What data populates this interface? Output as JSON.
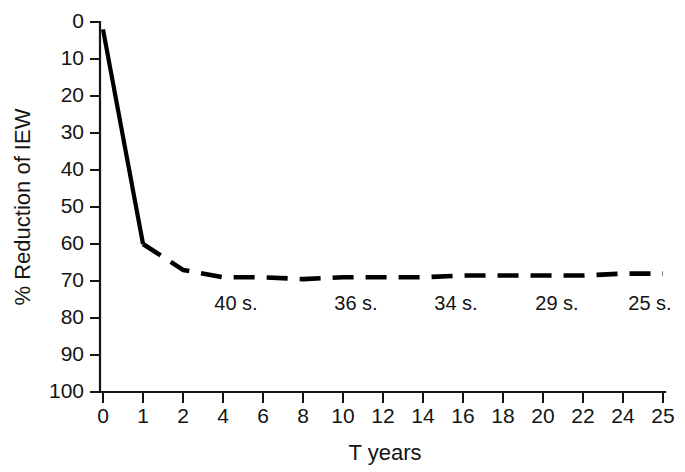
{
  "chart_data": {
    "type": "line",
    "title": "",
    "xlabel": "T years",
    "ylabel": "% Reduction of IEW",
    "xlim": [
      0,
      25
    ],
    "ylim": [
      0,
      100
    ],
    "y_axis_inverted": true,
    "grid": false,
    "legend": "none",
    "x_tick_labels": [
      "0",
      "1",
      "2",
      "4",
      "6",
      "8",
      "10",
      "12",
      "14",
      "16",
      "18",
      "20",
      "22",
      "24",
      "25"
    ],
    "y_tick_labels": [
      "0",
      "10",
      "20",
      "30",
      "40",
      "50",
      "60",
      "70",
      "80",
      "90",
      "100"
    ],
    "x": [
      0,
      1,
      2,
      4,
      6,
      8,
      10,
      12,
      14,
      16,
      18,
      20,
      22,
      24,
      25
    ],
    "values": [
      2,
      60,
      67,
      69,
      69,
      69.5,
      69,
      69,
      69,
      68.5,
      68.5,
      68.5,
      68.5,
      68,
      68
    ],
    "series": [
      {
        "name": "% Reduction of IEW",
        "values": [
          2,
          60,
          67,
          69,
          69,
          69.5,
          69,
          69,
          69,
          68.5,
          68.5,
          68.5,
          68.5,
          68,
          68
        ]
      }
    ],
    "annotations": [
      {
        "text": "40 s.",
        "x": 4,
        "y": 75
      },
      {
        "text": "36 s.",
        "x": 10,
        "y": 75
      },
      {
        "text": "34 s.",
        "x": 14,
        "y": 75
      },
      {
        "text": "29 s.",
        "x": 18,
        "y": 75
      },
      {
        "text": "25 s.",
        "x": 24,
        "y": 75
      }
    ],
    "colors": {
      "line": "#000000",
      "axis": "#141414",
      "background": "#ffffff",
      "text": "#141414"
    }
  }
}
